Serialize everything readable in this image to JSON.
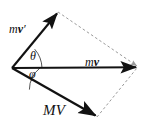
{
  "figure": {
    "background_color": "#ffffff",
    "stroke_color": "#121212",
    "dashed_color": "#9a9a9a",
    "width": 153,
    "height": 130,
    "labels": {
      "mv_prime": "mv′",
      "mv_prime_scalar": "m",
      "mv_prime_vector": "v",
      "mv_prime_mark": "′",
      "mv": "mv",
      "mv_scalar": "m",
      "mv_vector": "v",
      "MV": "MV",
      "theta": "θ",
      "phi": "φ"
    },
    "vectors": [
      {
        "name": "mv-prime",
        "label": "mv′",
        "origin": [
          12,
          68
        ],
        "tip": [
          58,
          12
        ],
        "style": "solid",
        "arrowhead": true
      },
      {
        "name": "mv",
        "label": "mv",
        "origin": [
          12,
          68
        ],
        "tip": [
          138,
          67
        ],
        "style": "solid",
        "arrowhead": true
      },
      {
        "name": "MV",
        "label": "MV",
        "origin": [
          12,
          68
        ],
        "tip": [
          97,
          117
        ],
        "style": "solid",
        "arrowhead": true
      }
    ],
    "construction_lines": [
      {
        "name": "mv-prime-to-resultant",
        "from": [
          58,
          12
        ],
        "to": [
          138,
          67
        ],
        "style": "dashed"
      },
      {
        "name": "MV-to-resultant",
        "from": [
          97,
          117
        ],
        "to": [
          138,
          67
        ],
        "style": "dashed"
      }
    ],
    "angles": [
      {
        "name": "theta",
        "symbol": "θ",
        "between": [
          "mv-prime",
          "mv"
        ],
        "vertex": [
          12,
          68
        ]
      },
      {
        "name": "phi",
        "symbol": "φ",
        "between": [
          "mv",
          "MV"
        ],
        "vertex": [
          12,
          68
        ]
      }
    ]
  }
}
